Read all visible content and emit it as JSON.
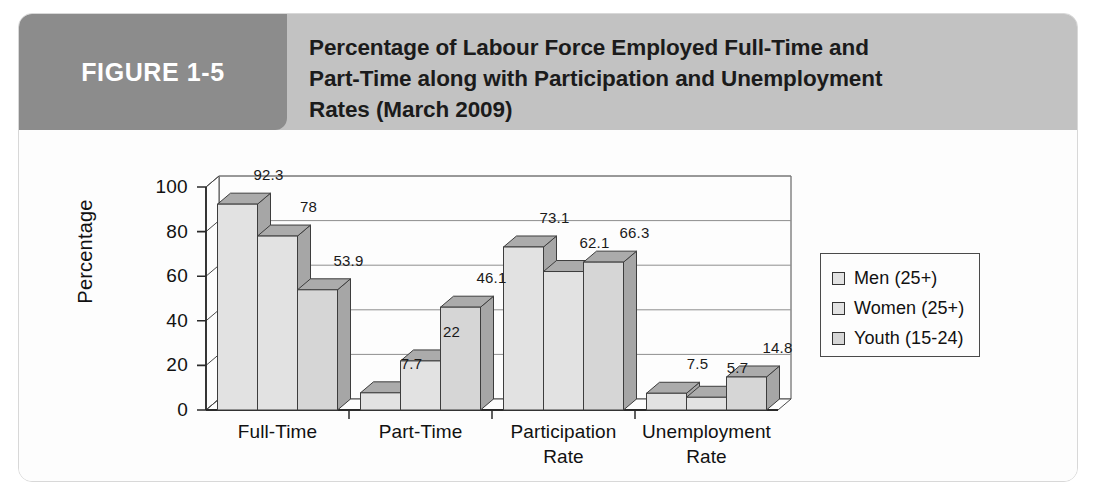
{
  "figure": {
    "badge_label": "FIGURE 1-5",
    "title_lines": [
      "Percentage of Labour Force Employed Full-Time and",
      "Part-Time along with Participation and Unemployment",
      "Rates (March 2009)"
    ],
    "badge_color": "#8c8c8c",
    "band_color": "#c2c2c2",
    "frame_color": "#d8d8d8"
  },
  "chart_data": {
    "type": "bar",
    "title": "Percentage of Labour Force Employed Full-Time and Part-Time along with Participation and Unemployment Rates (March 2009)",
    "xlabel": "",
    "ylabel": "Percentage",
    "ylim": [
      0,
      100
    ],
    "yticks": [
      0,
      20,
      40,
      60,
      80,
      100
    ],
    "ytick_labels": [
      "0",
      "20",
      "40",
      "60",
      "80",
      "100"
    ],
    "grid": true,
    "legend_position": "right",
    "three_d": true,
    "categories": [
      "Full-Time",
      "Part-Time",
      "Participation\nRate",
      "Unemployment\nRate"
    ],
    "series": [
      {
        "name": "Men (25+)",
        "values": [
          92.3,
          7.7,
          73.1,
          7.5
        ],
        "labels": [
          "92.3",
          "7.7",
          "73.1",
          "7.5"
        ],
        "color": "#e2e2e2"
      },
      {
        "name": "Women (25+)",
        "values": [
          78,
          22,
          62.1,
          5.7
        ],
        "labels": [
          "78",
          "22",
          "62.1",
          "5.7"
        ],
        "color": "#e2e2e2"
      },
      {
        "name": "Youth (15-24)",
        "values": [
          53.9,
          46.1,
          66.3,
          14.8
        ],
        "labels": [
          "53.9",
          "46.1",
          "66.3",
          "14.8"
        ],
        "color": "#d6d6d6"
      }
    ]
  }
}
